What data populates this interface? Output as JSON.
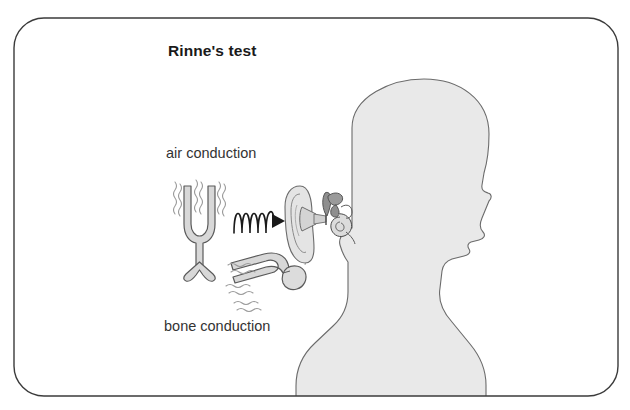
{
  "figure": {
    "title": "Rinne's test",
    "labels": {
      "air_conduction": "air conduction",
      "bone_conduction": "bone conduction"
    },
    "colors": {
      "frame_border": "#3b3b3b",
      "background": "#ffffff",
      "head_fill": "#e9e9e9",
      "head_outline": "#6b6b6b",
      "fork_fill": "#d8d8d8",
      "fork_outline": "#5a5a5a",
      "wave_stroke": "#1a1a1a",
      "squiggle_stroke": "#9a9a9a",
      "title_color": "#1a1a1a",
      "label_color": "#333333"
    },
    "illustration": {
      "subject": "head-profile-facing-left",
      "elements": [
        "rounded-frame",
        "head-silhouette",
        "outer-ear-pinna",
        "ear-canal",
        "middle-ear-ossicles",
        "cochlea",
        "air-conduction-tuning-fork",
        "sound-wave-arrow",
        "bone-conduction-tuning-fork",
        "vibration-squiggles"
      ]
    }
  }
}
